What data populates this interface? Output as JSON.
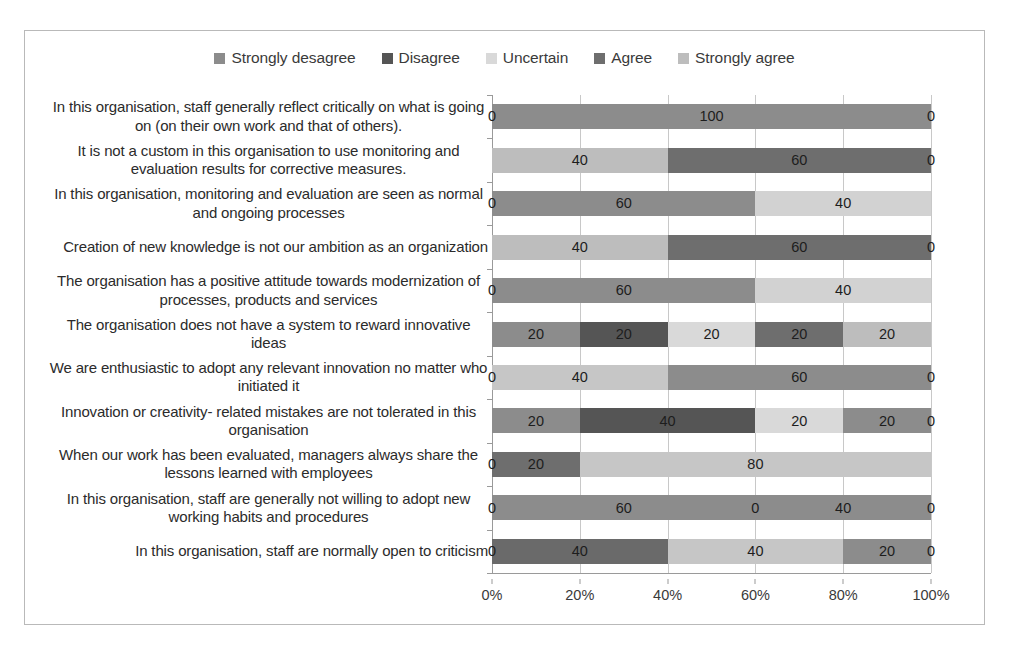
{
  "chart_data": {
    "type": "bar",
    "orientation": "horizontal",
    "stacked": true,
    "stack_mode": "percent",
    "title": "",
    "xlabel": "",
    "ylabel": "",
    "xlim": [
      0,
      100
    ],
    "xticks": [
      "0%",
      "20%",
      "40%",
      "60%",
      "80%",
      "100%"
    ],
    "xtick_values": [
      0,
      20,
      40,
      60,
      80,
      100
    ],
    "grid": true,
    "legend_position": "top",
    "legend": [
      "Strongly desagree",
      "Disagree",
      "Uncertain",
      "Agree",
      "Strongly agree"
    ],
    "colors": [
      "#8c8c8c",
      "#555555",
      "#d9d9d9",
      "#6e6e6e",
      "#bdbdbd"
    ],
    "categories": [
      "In this organisation, staff generally reflect critically on what is going on (on their own work and that of others).",
      "It is not a custom in this organisation to use monitoring and evaluation results for corrective measures.",
      "In this organisation, monitoring and evaluation are seen as normal and ongoing processes",
      "Creation of new knowledge is not our ambition as an organization",
      "The organisation has a positive attitude towards modernization of processes, products and services",
      "The organisation does not have a system to reward innovative ideas",
      "We are enthusiastic to adopt any relevant innovation no matter who initiated it",
      "Innovation or creativity- related mistakes are not tolerated in this organisation",
      "When our work has been evaluated, managers always share the lessons learned with employees",
      "In this organisation, staff are generally not willing to adopt new working habits and procedures",
      "In this organisation, staff are normally open to criticism"
    ],
    "series": [
      {
        "name": "Strongly desagree",
        "values": [
          0,
          0,
          0,
          0,
          0,
          20,
          0,
          20,
          0,
          0,
          0
        ]
      },
      {
        "name": "Disagree",
        "values": [
          100,
          0,
          60,
          0,
          60,
          20,
          0,
          40,
          20,
          60,
          40
        ]
      },
      {
        "name": "Uncertain",
        "values": [
          0,
          40,
          40,
          40,
          40,
          20,
          40,
          20,
          80,
          0,
          40
        ]
      },
      {
        "name": "Agree",
        "values": [
          0,
          60,
          0,
          60,
          0,
          20,
          60,
          20,
          0,
          40,
          20
        ]
      },
      {
        "name": "Strongly agree",
        "values": [
          0,
          0,
          0,
          0,
          0,
          20,
          0,
          0,
          0,
          0,
          0
        ]
      }
    ],
    "rows": [
      {
        "label": "In this organisation, staff generally reflect critically on what is going on (on their own work and that of others).",
        "segments": [
          {
            "series": "Strongly desagree",
            "value": 0,
            "label": "0",
            "color": "#8c8c8c"
          },
          {
            "series": "Disagree",
            "value": 100,
            "label": "100",
            "color": "#8c8c8c"
          },
          {
            "series": "Uncertain",
            "value": 0,
            "label": "0",
            "color": "#d9d9d9"
          }
        ]
      },
      {
        "label": "It is not a custom in this organisation to use monitoring and evaluation results for corrective measures.",
        "segments": [
          {
            "series": "Uncertain",
            "value": 40,
            "label": "40",
            "color": "#bdbdbd"
          },
          {
            "series": "Agree",
            "value": 60,
            "label": "60",
            "color": "#6e6e6e"
          },
          {
            "series": "Strongly agree",
            "value": 0,
            "label": "0",
            "color": "#bdbdbd"
          }
        ]
      },
      {
        "label": "In this organisation, monitoring and evaluation are seen as normal and ongoing processes",
        "segments": [
          {
            "series": "Strongly desagree",
            "value": 0,
            "label": "0",
            "color": "#8c8c8c"
          },
          {
            "series": "Disagree",
            "value": 60,
            "label": "60",
            "color": "#8c8c8c"
          },
          {
            "series": "Uncertain",
            "value": 40,
            "label": "40",
            "color": "#d2d2d2"
          }
        ]
      },
      {
        "label": "Creation of new knowledge is not our ambition as an organization",
        "segments": [
          {
            "series": "Uncertain",
            "value": 40,
            "label": "40",
            "color": "#bdbdbd"
          },
          {
            "series": "Agree",
            "value": 60,
            "label": "60",
            "color": "#6e6e6e"
          },
          {
            "series": "Strongly agree",
            "value": 0,
            "label": "0",
            "color": "#bdbdbd"
          }
        ]
      },
      {
        "label": "The organisation has a positive attitude towards modernization of processes, products and services",
        "segments": [
          {
            "series": "Strongly desagree",
            "value": 0,
            "label": "0",
            "color": "#8c8c8c"
          },
          {
            "series": "Disagree",
            "value": 60,
            "label": "60",
            "color": "#8c8c8c"
          },
          {
            "series": "Uncertain",
            "value": 40,
            "label": "40",
            "color": "#d2d2d2"
          }
        ]
      },
      {
        "label": "The organisation does not have a system to reward innovative ideas",
        "segments": [
          {
            "series": "Strongly desagree",
            "value": 20,
            "label": "20",
            "color": "#8c8c8c"
          },
          {
            "series": "Disagree",
            "value": 20,
            "label": "20",
            "color": "#555555"
          },
          {
            "series": "Uncertain",
            "value": 20,
            "label": "20",
            "color": "#d9d9d9"
          },
          {
            "series": "Agree",
            "value": 20,
            "label": "20",
            "color": "#6e6e6e"
          },
          {
            "series": "Strongly agree",
            "value": 20,
            "label": "20",
            "color": "#bdbdbd"
          }
        ]
      },
      {
        "label": "We are enthusiastic to adopt any relevant innovation no matter who initiated it",
        "segments": [
          {
            "series": "Strongly desagree",
            "value": 0,
            "label": "0",
            "color": "#8c8c8c"
          },
          {
            "series": "Uncertain",
            "value": 40,
            "label": "40",
            "color": "#c6c6c6"
          },
          {
            "series": "Agree",
            "value": 60,
            "label": "60",
            "color": "#8c8c8c"
          },
          {
            "series": "Strongly agree",
            "value": 0,
            "label": "0",
            "color": "#bdbdbd"
          }
        ]
      },
      {
        "label": "Innovation or creativity- related mistakes are not tolerated in this organisation",
        "segments": [
          {
            "series": "Strongly desagree",
            "value": 20,
            "label": "20",
            "color": "#8c8c8c"
          },
          {
            "series": "Disagree",
            "value": 40,
            "label": "40",
            "color": "#555555"
          },
          {
            "series": "Uncertain",
            "value": 20,
            "label": "20",
            "color": "#d9d9d9"
          },
          {
            "series": "Agree",
            "value": 20,
            "label": "20",
            "color": "#8c8c8c"
          },
          {
            "series": "Strongly agree",
            "value": 0,
            "label": "0",
            "color": "#bdbdbd"
          }
        ]
      },
      {
        "label": "When our work has been evaluated, managers always share the lessons learned with employees",
        "segments": [
          {
            "series": "Strongly desagree",
            "value": 0,
            "label": "0",
            "color": "#8c8c8c"
          },
          {
            "series": "Disagree",
            "value": 20,
            "label": "20",
            "color": "#6e6e6e"
          },
          {
            "series": "Uncertain",
            "value": 80,
            "label": "80",
            "color": "#c6c6c6"
          }
        ]
      },
      {
        "label": "In this organisation, staff are generally not willing to adopt new working habits and procedures",
        "segments": [
          {
            "series": "Strongly desagree",
            "value": 0,
            "label": "0",
            "color": "#8c8c8c"
          },
          {
            "series": "Disagree",
            "value": 60,
            "label": "60",
            "color": "#8c8c8c"
          },
          {
            "series": "Uncertain",
            "value": 0,
            "label": "0",
            "color": "#8c8c8c"
          },
          {
            "series": "Agree",
            "value": 40,
            "label": "40",
            "color": "#8c8c8c"
          },
          {
            "series": "Strongly agree",
            "value": 0,
            "label": "0",
            "color": "#bdbdbd"
          }
        ]
      },
      {
        "label": "In this organisation, staff are normally open to criticism",
        "segments": [
          {
            "series": "Strongly desagree",
            "value": 0,
            "label": "0",
            "color": "#8c8c8c"
          },
          {
            "series": "Disagree",
            "value": 40,
            "label": "40",
            "color": "#6a6a6a"
          },
          {
            "series": "Uncertain",
            "value": 40,
            "label": "40",
            "color": "#c6c6c6"
          },
          {
            "series": "Agree",
            "value": 20,
            "label": "20",
            "color": "#8c8c8c"
          },
          {
            "series": "Strongly agree",
            "value": 0,
            "label": "0",
            "color": "#bdbdbd"
          }
        ]
      }
    ]
  }
}
